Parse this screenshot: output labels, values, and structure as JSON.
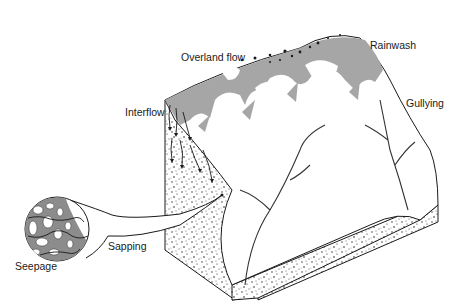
{
  "diagram": {
    "type": "block-diagram",
    "labels": {
      "overland_flow": "Overland flow",
      "rainwash": "Rainwash",
      "interflow": "Interflow",
      "gullying": "Gullying",
      "sapping": "Sapping",
      "seepage": "Seepage"
    },
    "colors": {
      "flow_shading": "#a6a6a6",
      "outline": "#1a1a1a",
      "background": "#ffffff",
      "seepage_matrix": "#8c8c8c"
    }
  }
}
